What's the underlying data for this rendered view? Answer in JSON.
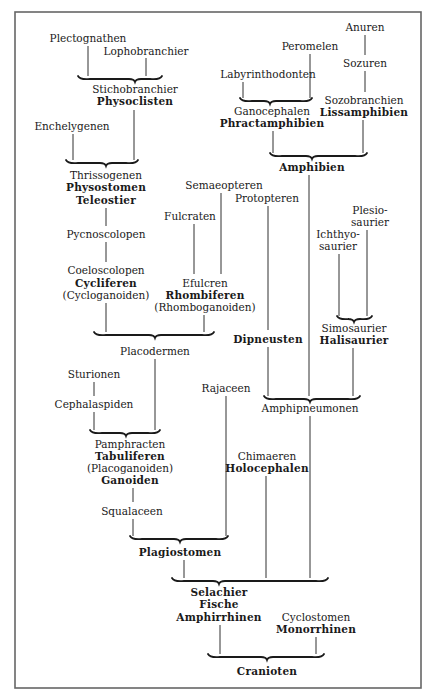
{
  "diagram": {
    "type": "phylogenetic-tree",
    "colors": {
      "ink": "#1a1a1a",
      "frame": "#555555",
      "paper": "#ffffff"
    },
    "nodes": [
      {
        "id": "plectognathen",
        "text": "Plectognathen",
        "bold": false
      },
      {
        "id": "lophobranchier",
        "text": "Lophobranchier",
        "bold": false
      },
      {
        "id": "stichobranchier",
        "text": "Stichobranchier",
        "bold": false
      },
      {
        "id": "physoclisten",
        "text": "Physoclisten",
        "bold": true
      },
      {
        "id": "enchelygenen",
        "text": "Enchelygenen",
        "bold": false
      },
      {
        "id": "thrissogenen",
        "text": "Thrissogenen",
        "bold": false
      },
      {
        "id": "physostomen",
        "text": "Physostomen",
        "bold": true
      },
      {
        "id": "teleostier",
        "text": "Teleostier",
        "bold": true
      },
      {
        "id": "pycnoscolopen",
        "text": "Pycnoscolopen",
        "bold": false
      },
      {
        "id": "coeloscolopen",
        "text": "Coeloscolopen",
        "bold": false
      },
      {
        "id": "cycliferen",
        "text": "Cycliferen",
        "bold": true
      },
      {
        "id": "cycloganoiden",
        "text": "(Cycloganoiden)",
        "bold": false
      },
      {
        "id": "semaeopteren",
        "text": "Semaeopteren",
        "bold": false
      },
      {
        "id": "fulcraten",
        "text": "Fulcraten",
        "bold": false
      },
      {
        "id": "efulcren",
        "text": "Efulcren",
        "bold": false
      },
      {
        "id": "rhombiferen",
        "text": "Rhombiferen",
        "bold": true
      },
      {
        "id": "rhomboganoiden",
        "text": "(Rhomboganoiden)",
        "bold": false
      },
      {
        "id": "placodermen",
        "text": "Placodermen",
        "bold": false
      },
      {
        "id": "sturionen",
        "text": "Sturionen",
        "bold": false
      },
      {
        "id": "cephalaspiden",
        "text": "Cephalaspiden",
        "bold": false
      },
      {
        "id": "pamphracten",
        "text": "Pamphracten",
        "bold": false
      },
      {
        "id": "tabuliferen",
        "text": "Tabuliferen",
        "bold": true
      },
      {
        "id": "placoganoiden",
        "text": "(Placoganoiden)",
        "bold": false
      },
      {
        "id": "ganoiden",
        "text": "Ganoiden",
        "bold": true
      },
      {
        "id": "squalaceen",
        "text": "Squalaceen",
        "bold": false
      },
      {
        "id": "plagiostomen",
        "text": "Plagiostomen",
        "bold": true
      },
      {
        "id": "rajaceen",
        "text": "Rajaceen",
        "bold": false
      },
      {
        "id": "peromelen",
        "text": "Peromelen",
        "bold": false
      },
      {
        "id": "labyrinthodonten",
        "text": "Labyrinthodonten",
        "bold": false
      },
      {
        "id": "ganocephalen",
        "text": "Ganocephalen",
        "bold": false
      },
      {
        "id": "phractamphibien",
        "text": "Phractamphibien",
        "bold": true
      },
      {
        "id": "anuren",
        "text": "Anuren",
        "bold": false
      },
      {
        "id": "sozuren",
        "text": "Sozuren",
        "bold": false
      },
      {
        "id": "sozobranchien",
        "text": "Sozobranchien",
        "bold": false
      },
      {
        "id": "lissamphibien",
        "text": "Lissamphibien",
        "bold": true
      },
      {
        "id": "amphibien",
        "text": "Amphibien",
        "bold": true
      },
      {
        "id": "protopteren",
        "text": "Protopteren",
        "bold": false
      },
      {
        "id": "plesiosaurier_1",
        "text": "Plesio-",
        "bold": false
      },
      {
        "id": "plesiosaurier_2",
        "text": "saurier",
        "bold": false
      },
      {
        "id": "ichthyosaurier_1",
        "text": "Ichthyo-",
        "bold": false
      },
      {
        "id": "ichthyosaurier_2",
        "text": "saurier",
        "bold": false
      },
      {
        "id": "dipneusten",
        "text": "Dipneusten",
        "bold": true
      },
      {
        "id": "simosaurier",
        "text": "Simosaurier",
        "bold": false
      },
      {
        "id": "halisaurier",
        "text": "Halisaurier",
        "bold": true
      },
      {
        "id": "amphipneumonen",
        "text": "Amphipneumonen",
        "bold": false
      },
      {
        "id": "chimaeren",
        "text": "Chimaeren",
        "bold": false
      },
      {
        "id": "holocephalen",
        "text": "Holocephalen",
        "bold": true
      },
      {
        "id": "selachier",
        "text": "Selachier",
        "bold": true
      },
      {
        "id": "fische",
        "text": "Fische",
        "bold": true
      },
      {
        "id": "amphirrhinen",
        "text": "Amphirrhinen",
        "bold": true
      },
      {
        "id": "cyclostomen",
        "text": "Cyclostomen",
        "bold": false
      },
      {
        "id": "monorrhinen",
        "text": "Monorrhinen",
        "bold": true
      },
      {
        "id": "cranioten",
        "text": "Cranioten",
        "bold": true
      }
    ],
    "edges": [
      [
        "plectognathen",
        "stichobranchier"
      ],
      [
        "lophobranchier",
        "stichobranchier"
      ],
      [
        "physoclisten",
        "thrissogenen"
      ],
      [
        "enchelygenen",
        "thrissogenen"
      ],
      [
        "pycnoscolopen",
        "teleostier"
      ],
      [
        "coeloscolopen",
        "pycnoscolopen"
      ],
      [
        "cycloganoiden",
        "placodermen"
      ],
      [
        "rhomboganoiden",
        "placodermen"
      ],
      [
        "fulcraten",
        "efulcren"
      ],
      [
        "semaeopteren",
        "efulcren"
      ],
      [
        "placodermen",
        "pamphracten"
      ],
      [
        "sturionen",
        "cephalaspiden"
      ],
      [
        "cephalaspiden",
        "pamphracten"
      ],
      [
        "ganoiden",
        "squalaceen"
      ],
      [
        "squalaceen",
        "plagiostomen"
      ],
      [
        "rajaceen",
        "plagiostomen"
      ],
      [
        "labyrinthodonten",
        "ganocephalen"
      ],
      [
        "peromelen",
        "ganocephalen"
      ],
      [
        "anuren",
        "sozuren"
      ],
      [
        "sozuren",
        "sozobranchien"
      ],
      [
        "phractamphibien",
        "amphibien"
      ],
      [
        "lissamphibien",
        "amphibien"
      ],
      [
        "amphibien",
        "amphipneumonen"
      ],
      [
        "protopteren",
        "dipneusten"
      ],
      [
        "dipneusten",
        "amphipneumonen"
      ],
      [
        "ichthyosaurier_2",
        "simosaurier"
      ],
      [
        "plesiosaurier_2",
        "simosaurier"
      ],
      [
        "halisaurier",
        "amphipneumonen"
      ],
      [
        "plagiostomen",
        "selachier"
      ],
      [
        "holocephalen",
        "selachier"
      ],
      [
        "amphipneumonen",
        "selachier"
      ],
      [
        "amphirrhinen",
        "cranioten"
      ],
      [
        "monorrhinen",
        "cranioten"
      ]
    ]
  }
}
